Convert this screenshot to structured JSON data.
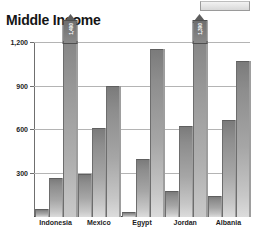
{
  "window": {
    "top_chip_name": "toolbar-chip"
  },
  "chart_data": {
    "type": "bar",
    "title": "Middle Income",
    "xlabel": "",
    "ylabel": "",
    "categories": [
      "Indonesia",
      "Mexico",
      "Egypt",
      "Jordan",
      "Albania"
    ],
    "series": [
      {
        "name": "series-1",
        "values": [
          45,
          285,
          25,
          170,
          140
        ]
      },
      {
        "name": "series-2",
        "values": [
          260,
          600,
          390,
          615,
          660
        ]
      },
      {
        "name": "series-3",
        "values": [
          1490,
          890,
          1145,
          1390,
          1060
        ]
      }
    ],
    "ylim": [
      0,
      1200
    ],
    "yticks": [
      300,
      600,
      900,
      1200
    ],
    "ytick_labels": [
      "300",
      "600",
      "900",
      "1,200"
    ],
    "grid": true,
    "legend": null,
    "annotations": [
      {
        "category": "Indonesia",
        "series": "series-3",
        "label": "1,490",
        "style": "off-scale-pennant"
      },
      {
        "category": "Jordan",
        "series": "series-3",
        "label": "1,390",
        "style": "off-scale-pennant"
      }
    ],
    "colors": {
      "bar_top": "#7b7b7b",
      "bar_bottom": "#dcdcdc",
      "grid": "#b4b4b4",
      "axis": "#4a4a4a",
      "text": "#1d1d1d",
      "background": "#ffffff"
    }
  }
}
